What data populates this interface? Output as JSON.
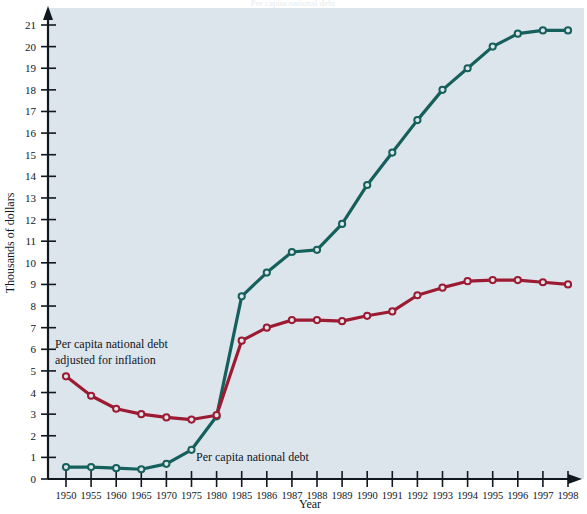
{
  "chart_data": {
    "type": "line",
    "title": "Per capita national debt",
    "xlabel": "Year",
    "ylabel": "Thousands of dollars",
    "categories": [
      "1950",
      "1955",
      "1960",
      "1965",
      "1970",
      "1975",
      "1980",
      "1985",
      "1986",
      "1987",
      "1988",
      "1989",
      "1990",
      "1991",
      "1992",
      "1993",
      "1994",
      "1995",
      "1996",
      "1997",
      "1998"
    ],
    "xlim": [
      0,
      20
    ],
    "ylim": [
      0,
      21
    ],
    "y_ticks": [
      0,
      1,
      2,
      3,
      4,
      5,
      6,
      7,
      8,
      9,
      10,
      11,
      12,
      13,
      14,
      15,
      16,
      17,
      18,
      19,
      20,
      21
    ],
    "grid": false,
    "legend_position": "inline-annotations",
    "series": [
      {
        "name": "Per capita national debt",
        "color": "#15605c",
        "marker": "open-circle",
        "annotation": "Per capita national debt",
        "values": [
          0.55,
          0.55,
          0.5,
          0.45,
          0.7,
          1.35,
          2.9,
          8.45,
          9.55,
          10.5,
          10.6,
          11.8,
          13.6,
          15.1,
          16.6,
          18.0,
          19.0,
          20.0,
          20.6,
          20.75,
          20.75
        ]
      },
      {
        "name": "Per capita national debt adjusted for inflation",
        "color": "#9c1b32",
        "marker": "open-circle",
        "annotation": "Per capita national debt adjusted for inflation",
        "values": [
          4.75,
          3.85,
          3.25,
          3.0,
          2.85,
          2.75,
          2.95,
          6.4,
          7.0,
          7.35,
          7.35,
          7.3,
          7.55,
          7.75,
          8.5,
          8.85,
          9.15,
          9.2,
          9.2,
          9.1,
          9.0
        ]
      }
    ]
  },
  "axes": {
    "y_title": "Thousands of dollars",
    "x_title": "Year",
    "y_tick_labels": [
      "0",
      "1",
      "2",
      "3",
      "4",
      "5",
      "6",
      "7",
      "8",
      "9",
      "10",
      "11",
      "12",
      "13",
      "14",
      "15",
      "16",
      "17",
      "18",
      "19",
      "20",
      "21"
    ],
    "x_tick_labels": [
      "1950",
      "1955",
      "1960",
      "1965",
      "1970",
      "1975",
      "1980",
      "1985",
      "1986",
      "1987",
      "1988",
      "1989",
      "1990",
      "1991",
      "1992",
      "1993",
      "1994",
      "1995",
      "1996",
      "1997",
      "1998"
    ]
  },
  "annotations": {
    "red_line_label_line1": "Per capita national debt",
    "red_line_label_line2": "adjusted for inflation",
    "teal_line_label": "Per capita national debt"
  },
  "colors": {
    "plot_background": "#dde5ec",
    "page_background": "#ffffff",
    "teal_series": "#15605c",
    "red_series": "#9c1b32",
    "axis": "#111820",
    "text": "#10161c"
  }
}
